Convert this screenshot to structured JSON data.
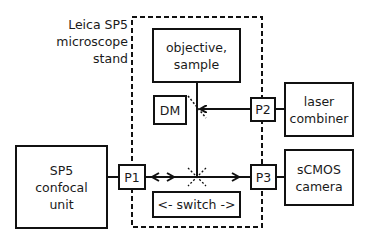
{
  "title_label": {
    "line1": "Leica SP5",
    "line2": "microscope",
    "line3": "stand"
  },
  "boxes": {
    "objective": {
      "line1": "objective,",
      "line2": "sample"
    },
    "dm": "DM",
    "laser": {
      "line1": "laser",
      "line2": "combiner"
    },
    "sp5": {
      "line1": "SP5",
      "line2": "confocal",
      "line3": "unit"
    },
    "camera": {
      "line1": "sCMOS",
      "line2": "camera"
    },
    "switch": "<- switch ->"
  },
  "ports": {
    "p1": "P1",
    "p2": "P2",
    "p3": "P3"
  },
  "colors": {
    "stroke": "#111111",
    "background": "#ffffff"
  }
}
